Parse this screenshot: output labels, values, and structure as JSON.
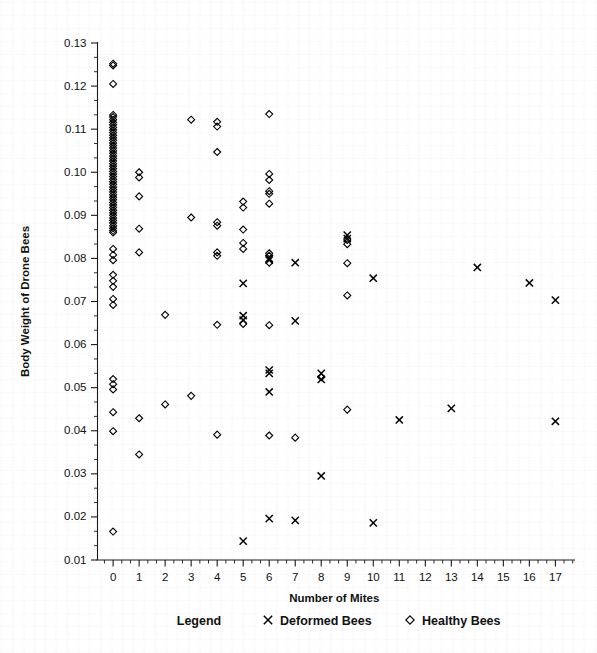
{
  "chart_data": {
    "type": "scatter",
    "title": "",
    "xlabel": "Number of Mites",
    "ylabel": "Body Weight of Drone Bees",
    "xlim": [
      -0.6,
      17.6
    ],
    "ylim": [
      0.01,
      0.13
    ],
    "grid": false,
    "x_ticks": [
      0,
      1,
      2,
      3,
      4,
      5,
      6,
      7,
      8,
      9,
      10,
      11,
      12,
      13,
      14,
      15,
      16,
      17
    ],
    "x_tick_labels": [
      "0",
      "1",
      "2",
      "3",
      "4",
      "5",
      "6",
      "7",
      "8",
      "9",
      "10",
      "11",
      "12",
      "13",
      "14",
      "15",
      "16",
      "17"
    ],
    "y_ticks": [
      0.01,
      0.02,
      0.03,
      0.04,
      0.05,
      0.06,
      0.07,
      0.08,
      0.09,
      0.1,
      0.11,
      0.12,
      0.13
    ],
    "y_tick_labels": [
      "0.01",
      "0.02",
      "0.03",
      "0.04",
      "0.05",
      "0.06",
      "0.07",
      "0.08",
      "0.09",
      "0.10",
      "0.11",
      "0.12",
      "0.13"
    ],
    "y_minor_per_major": 2,
    "x_minor_per_major": 2,
    "legend": {
      "position": "below-axis",
      "title": "Legend",
      "entries": [
        {
          "name": "Deformed Bees",
          "marker": "x"
        },
        {
          "name": "Healthy Bees",
          "marker": "diamond"
        }
      ]
    },
    "series": [
      {
        "name": "Healthy Bees",
        "marker": "diamond",
        "color": "#000000",
        "points": [
          [
            0,
            0.1252
          ],
          [
            0,
            0.1248
          ],
          [
            0,
            0.1205
          ],
          [
            0,
            0.1133
          ],
          [
            0,
            0.1128
          ],
          [
            0,
            0.1122
          ],
          [
            0,
            0.1116
          ],
          [
            0,
            0.111
          ],
          [
            0,
            0.1104
          ],
          [
            0,
            0.1098
          ],
          [
            0,
            0.1092
          ],
          [
            0,
            0.1086
          ],
          [
            0,
            0.108
          ],
          [
            0,
            0.1074
          ],
          [
            0,
            0.1068
          ],
          [
            0,
            0.1062
          ],
          [
            0,
            0.1056
          ],
          [
            0,
            0.105
          ],
          [
            0,
            0.1044
          ],
          [
            0,
            0.1038
          ],
          [
            0,
            0.1032
          ],
          [
            0,
            0.1026
          ],
          [
            0,
            0.102
          ],
          [
            0,
            0.1014
          ],
          [
            0,
            0.1008
          ],
          [
            0,
            0.1002
          ],
          [
            0,
            0.0996
          ],
          [
            0,
            0.099
          ],
          [
            0,
            0.0984
          ],
          [
            0,
            0.0978
          ],
          [
            0,
            0.0972
          ],
          [
            0,
            0.0966
          ],
          [
            0,
            0.096
          ],
          [
            0,
            0.0954
          ],
          [
            0,
            0.0948
          ],
          [
            0,
            0.0942
          ],
          [
            0,
            0.0936
          ],
          [
            0,
            0.093
          ],
          [
            0,
            0.0924
          ],
          [
            0,
            0.0918
          ],
          [
            0,
            0.0912
          ],
          [
            0,
            0.0906
          ],
          [
            0,
            0.09
          ],
          [
            0,
            0.0894
          ],
          [
            0,
            0.0888
          ],
          [
            0,
            0.0882
          ],
          [
            0,
            0.0876
          ],
          [
            0,
            0.087
          ],
          [
            0,
            0.0864
          ],
          [
            0,
            0.086
          ],
          [
            0,
            0.0822
          ],
          [
            0,
            0.0808
          ],
          [
            0,
            0.0796
          ],
          [
            0,
            0.0762
          ],
          [
            0,
            0.0748
          ],
          [
            0,
            0.0734
          ],
          [
            0,
            0.0706
          ],
          [
            0,
            0.0692
          ],
          [
            0,
            0.052
          ],
          [
            0,
            0.0508
          ],
          [
            0,
            0.0496
          ],
          [
            0,
            0.0443
          ],
          [
            0,
            0.0399
          ],
          [
            0,
            0.0166
          ],
          [
            1,
            0.1
          ],
          [
            1,
            0.0988
          ],
          [
            1,
            0.0944
          ],
          [
            1,
            0.0869
          ],
          [
            1,
            0.0814
          ],
          [
            1,
            0.0429
          ],
          [
            1,
            0.0345
          ],
          [
            2,
            0.0669
          ],
          [
            2,
            0.0461
          ],
          [
            3,
            0.1122
          ],
          [
            3,
            0.0895
          ],
          [
            3,
            0.0481
          ],
          [
            4,
            0.1117
          ],
          [
            4,
            0.1106
          ],
          [
            4,
            0.1047
          ],
          [
            4,
            0.0884
          ],
          [
            4,
            0.0876
          ],
          [
            4,
            0.0814
          ],
          [
            4,
            0.0806
          ],
          [
            4,
            0.0646
          ],
          [
            4,
            0.0391
          ],
          [
            5,
            0.0932
          ],
          [
            5,
            0.0918
          ],
          [
            5,
            0.0867
          ],
          [
            5,
            0.0836
          ],
          [
            5,
            0.0822
          ],
          [
            5,
            0.0648
          ],
          [
            6,
            0.1135
          ],
          [
            6,
            0.0996
          ],
          [
            6,
            0.0982
          ],
          [
            6,
            0.0956
          ],
          [
            6,
            0.095
          ],
          [
            6,
            0.0927
          ],
          [
            6,
            0.0812
          ],
          [
            6,
            0.0806
          ],
          [
            6,
            0.079
          ],
          [
            6,
            0.0645
          ],
          [
            6,
            0.0389
          ],
          [
            7,
            0.0384
          ],
          [
            8,
            0.0524
          ],
          [
            9,
            0.0843
          ],
          [
            9,
            0.0833
          ],
          [
            9,
            0.0789
          ],
          [
            9,
            0.0714
          ],
          [
            9,
            0.0449
          ]
        ]
      },
      {
        "name": "Deformed Bees",
        "marker": "x",
        "color": "#000000",
        "points": [
          [
            5,
            0.0742
          ],
          [
            5,
            0.0667
          ],
          [
            5,
            0.0657
          ],
          [
            5,
            0.0144
          ],
          [
            6,
            0.08
          ],
          [
            6,
            0.0796
          ],
          [
            6,
            0.0541
          ],
          [
            6,
            0.0533
          ],
          [
            6,
            0.049
          ],
          [
            6,
            0.0196
          ],
          [
            7,
            0.079
          ],
          [
            7,
            0.0655
          ],
          [
            7,
            0.0192
          ],
          [
            8,
            0.0533
          ],
          [
            8,
            0.0519
          ],
          [
            8,
            0.0295
          ],
          [
            9,
            0.0854
          ],
          [
            9,
            0.0846
          ],
          [
            10,
            0.0754
          ],
          [
            10,
            0.0186
          ],
          [
            11,
            0.0425
          ],
          [
            13,
            0.0452
          ],
          [
            14,
            0.0779
          ],
          [
            16,
            0.0743
          ],
          [
            17,
            0.0703
          ],
          [
            17,
            0.0422
          ]
        ]
      }
    ]
  }
}
